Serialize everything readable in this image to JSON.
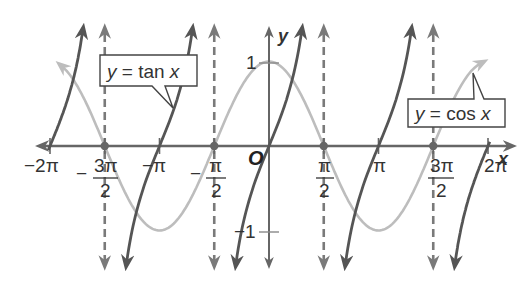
{
  "chart_data": {
    "type": "line",
    "title": "",
    "xlabel": "x",
    "ylabel": "y",
    "origin_label": "O",
    "xlim": [
      -6.2832,
      6.2832
    ],
    "ylim": [
      -1.4,
      1.4
    ],
    "grid": false,
    "x_ticks": [
      {
        "value": -6.2832,
        "label": "−2π",
        "num": "",
        "den": ""
      },
      {
        "value": -4.7124,
        "label": "−3π/2",
        "sign": "−",
        "num": "3π",
        "den": "2"
      },
      {
        "value": -3.1416,
        "label": "−π",
        "num": "",
        "den": ""
      },
      {
        "value": -1.5708,
        "label": "−π/2",
        "sign": "−",
        "num": "π",
        "den": "2"
      },
      {
        "value": 1.5708,
        "label": "π/2",
        "sign": "",
        "num": "π",
        "den": "2"
      },
      {
        "value": 3.1416,
        "label": "π",
        "num": "",
        "den": ""
      },
      {
        "value": 4.7124,
        "label": "3π/2",
        "sign": "",
        "num": "3π",
        "den": "2"
      },
      {
        "value": 6.2832,
        "label": "2π",
        "num": "",
        "den": ""
      }
    ],
    "y_ticks": [
      {
        "value": 1,
        "label": "1"
      },
      {
        "value": -1,
        "label": "−1"
      }
    ],
    "series": [
      {
        "name": "y = tan x",
        "function": "tan",
        "color": "#555555",
        "style": "solid"
      },
      {
        "name": "y = cos x",
        "function": "cos",
        "color": "#bdbdbd",
        "style": "solid"
      }
    ],
    "asymptotes": {
      "x_values": [
        -4.7124,
        -1.5708,
        1.5708,
        4.7124
      ],
      "color": "#7a7a7a",
      "style": "dashed"
    },
    "intersection_points_on_axis": [
      -4.7124,
      -1.5708,
      1.5708,
      4.7124
    ],
    "annotations": [
      {
        "text_var": "y",
        "text_eq": " = tan ",
        "text_x": "x",
        "target": "tan curve near x = -π + 0.6"
      },
      {
        "text_var": "y",
        "text_eq": " = cos ",
        "text_x": "x",
        "target": "cos curve near x = 5.6"
      }
    ]
  },
  "labels": {
    "tan_callout": {
      "y": "y",
      "eq": " = tan ",
      "x": "x"
    },
    "cos_callout": {
      "y": "y",
      "eq": " = cos ",
      "x": "x"
    },
    "x_axis": "x",
    "y_axis": "y",
    "origin": "O",
    "y_pos_one": "1",
    "y_neg_one": "−1",
    "x_neg_2pi": "−2π",
    "x_neg_pi": "−π",
    "x_pi": "π",
    "x_2pi": "2π",
    "frac_minus": "−",
    "frac_3pi": "3π",
    "frac_pi": "π",
    "frac_2": "2"
  }
}
